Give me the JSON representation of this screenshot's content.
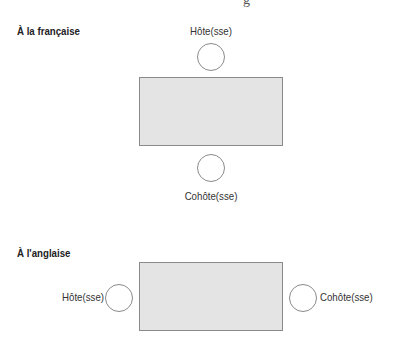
{
  "top_fragment": "g",
  "sections": [
    {
      "title": "À la française",
      "host_label": "Hôte(sse)",
      "cohost_label": "Cohôte(sse)",
      "layout": "vertical"
    },
    {
      "title": "À l'anglaise",
      "host_label": "Hôte(sse)",
      "cohost_label": "Cohôte(sse)",
      "layout": "horizontal"
    }
  ],
  "colors": {
    "table_fill": "#e4e4e4",
    "table_border": "#8a8a8a",
    "seat_border": "#8a8a8a"
  }
}
